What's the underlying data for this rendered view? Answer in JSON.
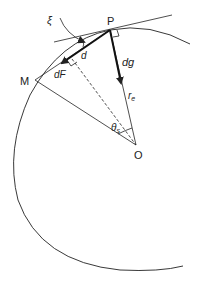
{
  "diagram": {
    "labels": {
      "P": "P",
      "M": "M",
      "O": "O",
      "xi": "ξ",
      "d": "d",
      "dF": "dF",
      "dg": "dg",
      "r": "r",
      "r_sub": "e",
      "theta": "θ",
      "theta_sub": "s"
    },
    "colors": {
      "stroke": "#222222",
      "background": "#ffffff"
    }
  }
}
